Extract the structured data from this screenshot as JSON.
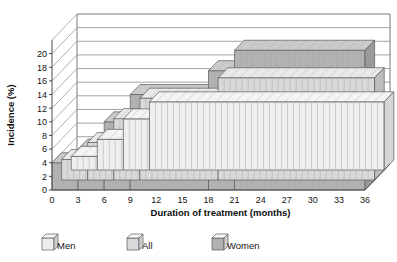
{
  "chart_data": {
    "type": "area",
    "title": "",
    "subtitle": "",
    "xlabel": "Duration of treatment (months)",
    "ylabel": "Incidence (%)",
    "xlim": [
      0,
      36
    ],
    "ylim": [
      0,
      20
    ],
    "x_ticks": [
      0,
      3,
      6,
      9,
      12,
      15,
      18,
      21,
      24,
      27,
      30,
      33,
      36
    ],
    "y_ticks": [
      0,
      2,
      4,
      6,
      8,
      10,
      12,
      14,
      16,
      18,
      20
    ],
    "grid": true,
    "legend_position": "bottom-left",
    "style": "3d-step-area",
    "x": [
      0,
      3,
      6,
      9,
      12,
      15,
      18,
      21,
      24,
      27,
      30,
      33,
      36
    ],
    "series": [
      {
        "name": "Men",
        "color": "#eeeeee",
        "side_color": "#d5d5d5",
        "top_color": "#f6f6f6",
        "values": [
          0,
          2.0,
          4.5,
          7.5,
          10.0,
          10.0,
          10.0,
          10.0,
          10.0,
          10.0,
          10.0,
          10.0,
          10.0
        ],
        "steps": [
          {
            "from": 0,
            "to": 3,
            "value": 2.0
          },
          {
            "from": 3,
            "to": 6,
            "value": 4.5
          },
          {
            "from": 6,
            "to": 9,
            "value": 7.5
          },
          {
            "from": 9,
            "to": 36,
            "value": 10.0
          }
        ]
      },
      {
        "name": "All",
        "color": "#d9d9d9",
        "side_color": "#bdbdbd",
        "top_color": "#e8e8e8",
        "values": [
          0,
          3.0,
          5.5,
          9.0,
          12.0,
          12.0,
          12.0,
          15.0,
          15.0,
          15.0,
          15.0,
          15.0,
          15.0
        ],
        "steps": [
          {
            "from": 0,
            "to": 3,
            "value": 3.0
          },
          {
            "from": 3,
            "to": 6,
            "value": 5.5
          },
          {
            "from": 6,
            "to": 9,
            "value": 9.0
          },
          {
            "from": 9,
            "to": 18,
            "value": 12.0
          },
          {
            "from": 18,
            "to": 36,
            "value": 15.0
          }
        ]
      },
      {
        "name": "Women",
        "color": "#b2b2b2",
        "side_color": "#9a9a9a",
        "top_color": "#c9c9c9",
        "values": [
          0,
          4.0,
          6.0,
          10.0,
          14.0,
          14.0,
          14.0,
          17.5,
          20.5,
          20.5,
          20.5,
          20.5,
          20.5
        ],
        "steps": [
          {
            "from": 0,
            "to": 3,
            "value": 4.0
          },
          {
            "from": 3,
            "to": 6,
            "value": 6.0
          },
          {
            "from": 6,
            "to": 9,
            "value": 10.0
          },
          {
            "from": 9,
            "to": 18,
            "value": 14.0
          },
          {
            "from": 18,
            "to": 21,
            "value": 17.5
          },
          {
            "from": 21,
            "to": 36,
            "value": 20.5
          }
        ]
      }
    ],
    "legend": [
      {
        "label": "Men",
        "color": "#eeeeee"
      },
      {
        "label": "All",
        "color": "#d9d9d9"
      },
      {
        "label": "Women",
        "color": "#b2b2b2"
      }
    ]
  }
}
